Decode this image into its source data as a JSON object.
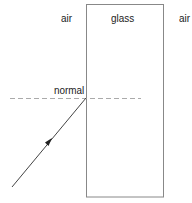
{
  "diagram": {
    "labels": {
      "air_left": "air",
      "glass": "glass",
      "air_right": "air",
      "normal": "normal"
    },
    "colors": {
      "block_stroke": "#888888",
      "normal_line": "#aaaaaa",
      "ray": "#444444"
    }
  }
}
